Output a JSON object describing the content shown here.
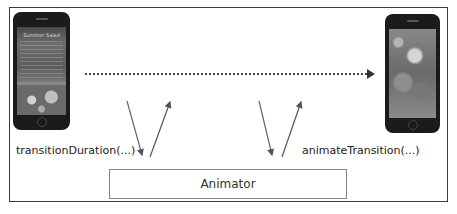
{
  "diagram": {
    "type": "flow",
    "nodes": [
      {
        "id": "from-vc",
        "kind": "phone-screenshot",
        "description": "source view controller screen (recipe detail with photo)",
        "screen_title": "Summer Salad"
      },
      {
        "id": "to-vc",
        "kind": "phone-screenshot",
        "description": "destination view controller screen (full photo)"
      },
      {
        "id": "animator",
        "kind": "box",
        "label": "Animator"
      }
    ],
    "edges": [
      {
        "from": "from-vc",
        "to": "to-vc",
        "style": "dotted",
        "arrow": "end"
      },
      {
        "from": "from-vc",
        "to": "animator",
        "label": "transitionDuration(...)",
        "style": "solid"
      },
      {
        "from": "animator",
        "to": "from-vc",
        "style": "solid"
      },
      {
        "from": "to-vc",
        "to": "animator",
        "label": "animateTransition(...)",
        "style": "solid"
      },
      {
        "from": "animator",
        "to": "to-vc",
        "style": "solid"
      }
    ]
  },
  "labels": {
    "left_call": "transitionDuration(...)",
    "right_call": "animateTransition(...)",
    "animator": "Animator",
    "left_screen_title": "Summer Salad"
  },
  "colors": {
    "frame": "#3a3a3a",
    "arrow": "#555555",
    "animator_border": "#888888",
    "text": "#222222"
  }
}
